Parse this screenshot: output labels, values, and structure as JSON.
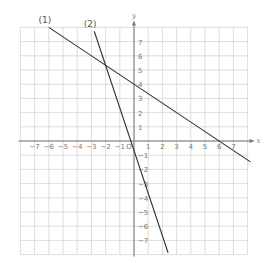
{
  "chart_data": {
    "type": "line",
    "title": "",
    "xlabel": "x",
    "ylabel": "y",
    "xlim": [
      -8,
      8
    ],
    "ylim": [
      -8,
      8
    ],
    "grid": true,
    "origin_label": "O",
    "x_ticks": [
      -7,
      -6,
      -5,
      -4,
      -3,
      -2,
      -1,
      1,
      2,
      3,
      4,
      5,
      6,
      7
    ],
    "y_ticks": [
      -7,
      -6,
      -5,
      -4,
      -3,
      -2,
      -1,
      1,
      2,
      3,
      4,
      5,
      6,
      7
    ],
    "series": [
      {
        "name": "(1)",
        "equation": "y = -2/3 x + 4",
        "x": [
          -6,
          8.2
        ],
        "y": [
          8,
          -1.47
        ],
        "points_on_line": [
          [
            0,
            4
          ],
          [
            6,
            0
          ]
        ]
      },
      {
        "name": "(2)",
        "equation": "y = -3x - 2/3",
        "x": [
          -2.8,
          2.4
        ],
        "y": [
          7.73,
          -7.87
        ],
        "points_on_line": [
          [
            -2,
            5.33
          ],
          [
            0,
            -0.67
          ]
        ]
      }
    ],
    "intersection": [
      -2,
      5.33
    ]
  },
  "style": {
    "grid_color": "#d4d4d4",
    "axis_color": "#777777",
    "line_color": "#333333"
  }
}
